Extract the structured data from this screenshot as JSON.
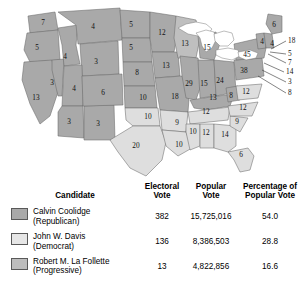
{
  "map": {
    "title": "Election of 1924 electoral vote map",
    "colors": {
      "coolidge": "#a9a9a9",
      "davis": "#dedede",
      "lafollette": "#bfbfbf",
      "water": "#ffffff",
      "outline": "#6b6b6b",
      "background": "#ffffff"
    },
    "states": [
      {
        "name": "Washington",
        "votes": "7",
        "winner": "coolidge",
        "x": 43,
        "y": 23
      },
      {
        "name": "Oregon",
        "votes": "5",
        "winner": "coolidge",
        "x": 37,
        "y": 48
      },
      {
        "name": "California",
        "votes": "13",
        "winner": "coolidge",
        "x": 36,
        "y": 98
      },
      {
        "name": "Nevada",
        "votes": "3",
        "winner": "coolidge",
        "x": 52,
        "y": 83
      },
      {
        "name": "Idaho",
        "votes": "4",
        "winner": "coolidge",
        "x": 65,
        "y": 57
      },
      {
        "name": "Montana",
        "votes": "4",
        "winner": "coolidge",
        "x": 93,
        "y": 27
      },
      {
        "name": "Wyoming",
        "votes": "3",
        "winner": "coolidge",
        "x": 96,
        "y": 62
      },
      {
        "name": "Utah",
        "votes": "4",
        "winner": "coolidge",
        "x": 74,
        "y": 89
      },
      {
        "name": "Arizona",
        "votes": "3",
        "winner": "coolidge",
        "x": 69,
        "y": 122
      },
      {
        "name": "New Mexico",
        "votes": "3",
        "winner": "coolidge",
        "x": 98,
        "y": 124
      },
      {
        "name": "Colorado",
        "votes": "6",
        "winner": "coolidge",
        "x": 103,
        "y": 93
      },
      {
        "name": "North Dakota",
        "votes": "5",
        "winner": "coolidge",
        "x": 131,
        "y": 25
      },
      {
        "name": "South Dakota",
        "votes": "5",
        "winner": "coolidge",
        "x": 131,
        "y": 48
      },
      {
        "name": "Nebraska",
        "votes": "8",
        "winner": "coolidge",
        "x": 137,
        "y": 73
      },
      {
        "name": "Kansas",
        "votes": "10",
        "winner": "coolidge",
        "x": 143,
        "y": 98
      },
      {
        "name": "Oklahoma",
        "votes": "10",
        "winner": "davis",
        "x": 148,
        "y": 117
      },
      {
        "name": "Texas",
        "votes": "20",
        "winner": "davis",
        "x": 136,
        "y": 146
      },
      {
        "name": "Minnesota",
        "votes": "12",
        "winner": "coolidge",
        "x": 162,
        "y": 33
      },
      {
        "name": "Iowa",
        "votes": "13",
        "winner": "coolidge",
        "x": 166,
        "y": 66
      },
      {
        "name": "Missouri",
        "votes": "18",
        "winner": "coolidge",
        "x": 175,
        "y": 97
      },
      {
        "name": "Arkansas",
        "votes": "9",
        "winner": "davis",
        "x": 177,
        "y": 123
      },
      {
        "name": "Louisiana",
        "votes": "10",
        "winner": "davis",
        "x": 179,
        "y": 145
      },
      {
        "name": "Wisconsin",
        "votes": "13",
        "winner": "lafollette",
        "x": 185,
        "y": 44
      },
      {
        "name": "Illinois",
        "votes": "29",
        "winner": "coolidge",
        "x": 189,
        "y": 84
      },
      {
        "name": "Michigan",
        "votes": "15",
        "winner": "coolidge",
        "x": 207,
        "y": 48
      },
      {
        "name": "Indiana",
        "votes": "15",
        "winner": "coolidge",
        "x": 204,
        "y": 84
      },
      {
        "name": "Ohio",
        "votes": "24",
        "winner": "coolidge",
        "x": 220,
        "y": 81
      },
      {
        "name": "Kentucky",
        "votes": "13",
        "winner": "coolidge",
        "x": 213,
        "y": 98
      },
      {
        "name": "Tennessee",
        "votes": "12",
        "winner": "davis",
        "x": 206,
        "y": 112
      },
      {
        "name": "Mississippi",
        "votes": "10",
        "winner": "davis",
        "x": 193,
        "y": 132
      },
      {
        "name": "Alabama",
        "votes": "12",
        "winner": "davis",
        "x": 206,
        "y": 133
      },
      {
        "name": "Georgia",
        "votes": "14",
        "winner": "davis",
        "x": 225,
        "y": 135
      },
      {
        "name": "Florida",
        "votes": "6",
        "winner": "davis",
        "x": 241,
        "y": 155
      },
      {
        "name": "South Carolina",
        "votes": "9",
        "winner": "davis",
        "x": 237,
        "y": 122
      },
      {
        "name": "North Carolina",
        "votes": "12",
        "winner": "davis",
        "x": 243,
        "y": 108
      },
      {
        "name": "West Virginia",
        "votes": "8",
        "winner": "coolidge",
        "x": 231,
        "y": 96
      },
      {
        "name": "Virginia",
        "votes": "12",
        "winner": "davis",
        "x": 246,
        "y": 92
      },
      {
        "name": "Pennsylvania",
        "votes": "38",
        "winner": "coolidge",
        "x": 244,
        "y": 71
      },
      {
        "name": "New York",
        "votes": "45",
        "winner": "coolidge",
        "x": 247,
        "y": 55
      },
      {
        "name": "Maine",
        "votes": "6",
        "winner": "coolidge",
        "x": 274,
        "y": 25
      },
      {
        "name": "Vermont",
        "votes": "4",
        "winner": "coolidge",
        "x": 262,
        "y": 42
      },
      {
        "name": "New Hampshire",
        "votes": "4",
        "winner": "coolidge",
        "x": 272,
        "y": 44
      }
    ],
    "callouts": [
      {
        "name": "Massachusetts",
        "votes": "18",
        "lx": 288,
        "ly": 41,
        "x1": 286,
        "y1": 41,
        "x2": 271,
        "y2": 49
      },
      {
        "name": "Rhode Island",
        "votes": "5",
        "lx": 288,
        "ly": 54,
        "x1": 286,
        "y1": 54,
        "x2": 270,
        "y2": 52
      },
      {
        "name": "Connecticut",
        "votes": "7",
        "lx": 288,
        "ly": 63,
        "x1": 286,
        "y1": 63,
        "x2": 268,
        "y2": 54
      },
      {
        "name": "New Jersey",
        "votes": "14",
        "lx": 286,
        "ly": 72,
        "x1": 284,
        "y1": 72,
        "x2": 264,
        "y2": 63
      },
      {
        "name": "Delaware",
        "votes": "3",
        "lx": 288,
        "ly": 82,
        "x1": 286,
        "y1": 82,
        "x2": 262,
        "y2": 70
      },
      {
        "name": "Maryland",
        "votes": "8",
        "lx": 288,
        "ly": 93,
        "x1": 286,
        "y1": 93,
        "x2": 258,
        "y2": 76
      }
    ]
  },
  "table": {
    "headers": {
      "candidate": "Candidate",
      "electoral_vote": "Electoral\nVote",
      "electoral_vote_l1": "Electoral",
      "electoral_vote_l2": "Vote",
      "popular_vote_l1": "Popular",
      "popular_vote_l2": "Vote",
      "percentage_l1": "Percentage of",
      "percentage_l2": "Popular Vote"
    },
    "rows": [
      {
        "swatch_color": "#a9a9a9",
        "swatch_name": "swatch-coolidge",
        "name": "Calvin Coolidge",
        "party": "(Republican)",
        "electoral_vote": "382",
        "popular_vote": "15,725,016",
        "percentage": "54.0"
      },
      {
        "swatch_color": "#e6e6e6",
        "swatch_name": "swatch-davis",
        "name": "John W. Davis",
        "party": "(Democrat)",
        "electoral_vote": "136",
        "popular_vote": "8,386,503",
        "percentage": "28.8"
      },
      {
        "swatch_color": "#bdbdbd",
        "swatch_name": "swatch-lafollette",
        "name": "Robert M. La Follette",
        "party": "(Progressive)",
        "electoral_vote": "13",
        "popular_vote": "4,822,856",
        "percentage": "16.6"
      }
    ]
  }
}
